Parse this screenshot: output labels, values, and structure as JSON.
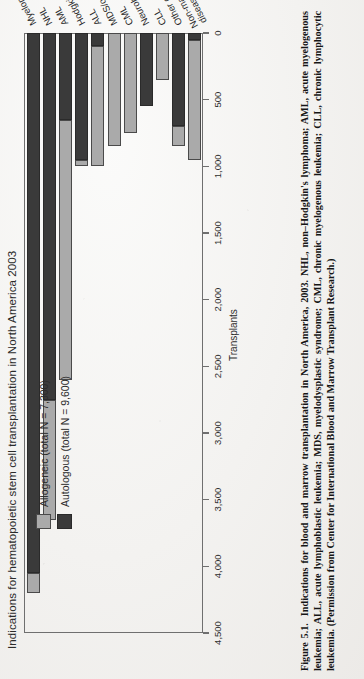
{
  "figure": {
    "number": "Figure 5.1.",
    "caption": "Indications for blood and marrow transplantation in North America, 2003. NHL, non–Hodgkin's lymphoma; AML, acute myelogenous leukemia; ALL, acute lymphoblastic leukemia; MDS, myelodysplastic syndrome; CML, chronic myelogenous leukemia; CLL, chronic lymphocytic leukemia. (Permission from Center for International Blood and Marrow Transplant Research.)"
  },
  "colors": {
    "allogeneic": "#aaaaaa",
    "autologous": "#3a3a3a",
    "axis": "#6f6f6f",
    "paper": "#f3f2f0",
    "ink": "#2b2b2b"
  },
  "chart_data": {
    "type": "bar",
    "orientation": "horizontal",
    "stacked": true,
    "title": "Indications for hematopoietic stem cell transplantation in North America 2003",
    "xlabel": "",
    "ylabel": "Transplants",
    "ylim": [
      0,
      4500
    ],
    "grid": false,
    "legend_position": "top-left",
    "tick_labels": [
      "4,500",
      "4,000",
      "3,500",
      "3,000",
      "2,500",
      "2,000",
      "1,500",
      "1,000",
      "500",
      "0"
    ],
    "tick_values": [
      4500,
      4000,
      3500,
      3000,
      2500,
      2000,
      1500,
      1000,
      500,
      0
    ],
    "categories": [
      "Myeloma",
      "NHL",
      "AML",
      "Hodgkin's",
      "ALL",
      "MDS/other leukemia",
      "CML",
      "Neuroblastoma",
      "CLL",
      "Other cancers",
      "Non-malignant diseases"
    ],
    "series": [
      {
        "name": "Autologous (total N = 9,600)",
        "short_name": "Autologous",
        "color": "#3a3a3a",
        "total": 9600,
        "values": [
          4050,
          2750,
          650,
          950,
          100,
          0,
          0,
          550,
          0,
          700,
          50
        ]
      },
      {
        "name": "Allogeneic (total N = 7,300)",
        "short_name": "Allogeneic",
        "color": "#aaaaaa",
        "total": 7300,
        "values": [
          150,
          900,
          1950,
          50,
          900,
          850,
          750,
          0,
          350,
          150,
          900
        ]
      }
    ],
    "legend": [
      "Allogeneic (total N = 7,300)",
      "Autologous (total N = 9,600)"
    ]
  }
}
